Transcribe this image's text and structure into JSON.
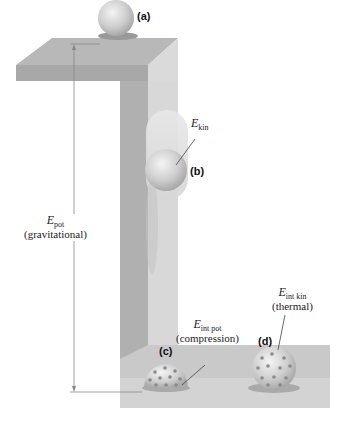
{
  "labels": {
    "a": "(a)",
    "b": "(b)",
    "c": "(c)",
    "d": "(d)"
  },
  "energies": {
    "kin": {
      "symbol": "E",
      "sub": "kin"
    },
    "pot": {
      "symbol": "E",
      "sub": "pot",
      "desc": "(gravitational)"
    },
    "int_pot": {
      "symbol": "E",
      "sub": "int pot",
      "desc": "(compression)"
    },
    "int_kin": {
      "symbol": "E",
      "sub": "int kin",
      "desc": "(thermal)"
    }
  },
  "colors": {
    "block_top": "#b5b5b5",
    "block_front": "#a6a6a6",
    "block_side": "#d8d8d8",
    "ball": "#c8c8c8",
    "dots": "#8a8a8a"
  }
}
